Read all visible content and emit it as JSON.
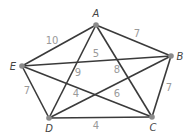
{
  "graph": {
    "vertices": [
      {
        "id": "A",
        "label": "A",
        "x": 96,
        "y": 25,
        "lx": 96,
        "ly": 14
      },
      {
        "id": "B",
        "label": "B",
        "x": 171,
        "y": 56,
        "lx": 180,
        "ly": 57
      },
      {
        "id": "C",
        "label": "C",
        "x": 152,
        "y": 117,
        "lx": 153,
        "ly": 128
      },
      {
        "id": "D",
        "label": "D",
        "x": 49,
        "y": 118,
        "lx": 49,
        "ly": 129
      },
      {
        "id": "E",
        "label": "E",
        "x": 22,
        "y": 66,
        "lx": 13,
        "ly": 67
      }
    ],
    "edges": [
      {
        "from": "A",
        "to": "E",
        "weight": "10",
        "lx": 52,
        "ly": 41
      },
      {
        "from": "A",
        "to": "B",
        "weight": "7",
        "lx": 137,
        "ly": 34
      },
      {
        "from": "B",
        "to": "C",
        "weight": "7",
        "lx": 169,
        "ly": 88
      },
      {
        "from": "E",
        "to": "D",
        "weight": "7",
        "lx": 27,
        "ly": 91
      },
      {
        "from": "D",
        "to": "C",
        "weight": "4",
        "lx": 96,
        "ly": 126
      },
      {
        "from": "E",
        "to": "B",
        "weight": "5",
        "lx": 96,
        "ly": 54
      },
      {
        "from": "A",
        "to": "D",
        "weight": "9",
        "lx": 78,
        "ly": 73
      },
      {
        "from": "A",
        "to": "C",
        "weight": "8",
        "lx": 117,
        "ly": 70
      },
      {
        "from": "E",
        "to": "C",
        "weight": "4",
        "lx": 76,
        "ly": 94
      },
      {
        "from": "D",
        "to": "B",
        "weight": "6",
        "lx": 117,
        "ly": 94
      }
    ]
  }
}
